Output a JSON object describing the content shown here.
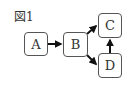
{
  "figure": {
    "label": "図1",
    "nodes": [
      {
        "id": "A",
        "label": "A"
      },
      {
        "id": "B",
        "label": "B"
      },
      {
        "id": "C",
        "label": "C"
      },
      {
        "id": "D",
        "label": "D"
      }
    ],
    "edges": [
      {
        "from": "A",
        "to": "B"
      },
      {
        "from": "B",
        "to": "C"
      },
      {
        "from": "B",
        "to": "D"
      },
      {
        "from": "D",
        "to": "C"
      }
    ]
  }
}
